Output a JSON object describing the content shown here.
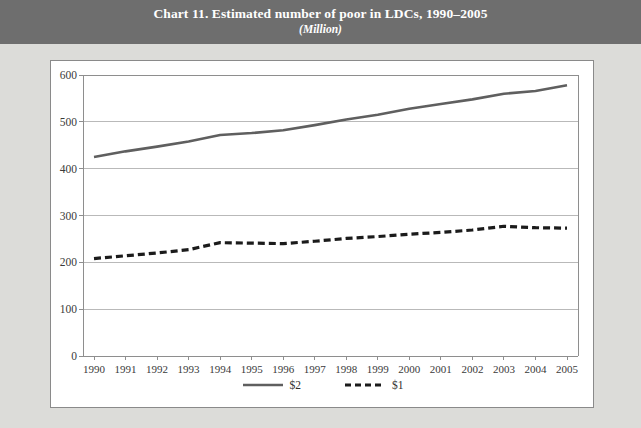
{
  "header": {
    "title": "Chart 11. Estimated number of poor in LDCs, 1990–2005",
    "subtitle": "(Million)"
  },
  "colors": {
    "band_background": "#6e6e6e",
    "band_text": "#ffffff",
    "page_background": "#dcdcd9",
    "panel_background": "#ffffff",
    "panel_border": "#8a8a8a",
    "gridline": "#b9b9b9",
    "axis": "#8e8e8e",
    "series_dollar2": "#5f5f5f",
    "series_dollar1": "#1b1b1b",
    "tick_text": "#3a3a3a"
  },
  "legend": {
    "position": "bottom-center",
    "entries": [
      {
        "label": "$2",
        "style": "solid",
        "icon": "solid-line-swatch"
      },
      {
        "label": "$1",
        "style": "dashed",
        "icon": "dashed-line-swatch"
      }
    ]
  },
  "axes": {
    "y_ticks": [
      "0",
      "100",
      "200",
      "300",
      "400",
      "500",
      "600"
    ],
    "x_ticks": [
      "1990",
      "1991",
      "1992",
      "1993",
      "1994",
      "1995",
      "1996",
      "1997",
      "1998",
      "1999",
      "2000",
      "2001",
      "2002",
      "2003",
      "2004",
      "2005"
    ]
  },
  "chart_data": {
    "type": "line",
    "title": "Chart 11. Estimated number of poor in LDCs, 1990–2005",
    "subtitle": "(Million)",
    "xlabel": "",
    "ylabel": "",
    "ylim": [
      0,
      600
    ],
    "yticks": [
      0,
      100,
      200,
      300,
      400,
      500,
      600
    ],
    "grid": true,
    "legend": "bottom-center",
    "x": [
      1990,
      1991,
      1992,
      1993,
      1994,
      1995,
      1996,
      1997,
      1998,
      1999,
      2000,
      2001,
      2002,
      2003,
      2004,
      2005
    ],
    "categories": [
      "1990",
      "1991",
      "1992",
      "1993",
      "1994",
      "1995",
      "1996",
      "1997",
      "1998",
      "1999",
      "2000",
      "2001",
      "2002",
      "2003",
      "2004",
      "2005"
    ],
    "series": [
      {
        "name": "$2",
        "style": "solid",
        "color": "#5f5f5f",
        "values": [
          425,
          437,
          447,
          458,
          472,
          476,
          482,
          493,
          505,
          515,
          528,
          538,
          548,
          560,
          566,
          578
        ]
      },
      {
        "name": "$1",
        "style": "dashed",
        "color": "#1b1b1b",
        "values": [
          208,
          214,
          220,
          227,
          242,
          241,
          240,
          245,
          251,
          255,
          260,
          264,
          269,
          277,
          274,
          273
        ]
      }
    ]
  }
}
